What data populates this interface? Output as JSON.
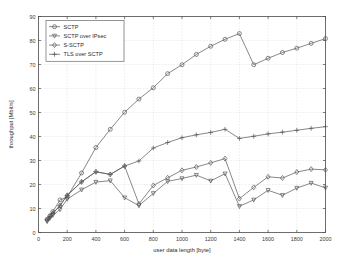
{
  "chart_data": {
    "type": "line",
    "title": "",
    "xlabel": "user data length [byte]",
    "ylabel": "throughput [Mbit/s]",
    "xlim": [
      0,
      2000
    ],
    "ylim": [
      0,
      90
    ],
    "xticks": [
      0,
      200,
      400,
      600,
      800,
      1000,
      1200,
      1400,
      1600,
      1800,
      2000
    ],
    "yticks": [
      0,
      10,
      20,
      30,
      40,
      50,
      60,
      70,
      80,
      90
    ],
    "grid": true,
    "legend_position": "upper left",
    "line_color": "#555555",
    "grid_color": "#c8c8c8",
    "axis_color": "#4a4a4a",
    "background": "#ffffff",
    "series": [
      {
        "name": "SCTP",
        "marker": "circle",
        "x": [
          60,
          80,
          100,
          150,
          200,
          300,
          400,
          500,
          600,
          700,
          800,
          900,
          1000,
          1100,
          1200,
          1300,
          1400,
          1500,
          1600,
          1700,
          1800,
          1900,
          2000
        ],
        "values": [
          5.5,
          7.0,
          8.7,
          13.6,
          14.8,
          24.8,
          35.4,
          43.0,
          50.1,
          55.6,
          60.3,
          66.2,
          69.9,
          74.2,
          77.6,
          80.5,
          82.9,
          69.9,
          72.6,
          75.0,
          76.8,
          78.8,
          80.8
        ]
      },
      {
        "name": "SCTP over IPsec",
        "marker": "triangle-down",
        "x": [
          60,
          80,
          100,
          150,
          200,
          300,
          400,
          500,
          600,
          700,
          800,
          900,
          1000,
          1100,
          1200,
          1300,
          1400,
          1500,
          1600,
          1700,
          1800,
          1900,
          2000
        ],
        "values": [
          4.6,
          6.0,
          7.2,
          9.6,
          13.9,
          17.8,
          21.0,
          21.6,
          14.5,
          11.2,
          16.3,
          21.3,
          22.5,
          23.9,
          21.5,
          24.5,
          10.9,
          13.6,
          17.6,
          15.5,
          18.5,
          20.6,
          18.6
        ]
      },
      {
        "name": "S-SCTP",
        "marker": "diamond",
        "x": [
          60,
          80,
          100,
          150,
          200,
          300,
          400,
          500,
          600,
          700,
          800,
          900,
          1000,
          1100,
          1200,
          1300,
          1400,
          1500,
          1600,
          1700,
          1800,
          1900,
          2000
        ],
        "values": [
          5.2,
          6.6,
          8.0,
          11.2,
          15.5,
          21.1,
          25.3,
          24.2,
          27.7,
          11.9,
          19.6,
          22.8,
          25.9,
          27.3,
          29.0,
          30.8,
          14.1,
          18.8,
          23.2,
          22.7,
          25.2,
          26.4,
          26.1
        ]
      },
      {
        "name": "TLS over SCTP",
        "marker": "plus",
        "x": [
          60,
          80,
          100,
          150,
          200,
          300,
          400,
          500,
          600,
          700,
          800,
          900,
          1000,
          1100,
          1200,
          1300,
          1400,
          1500,
          1600,
          1700,
          1800,
          1900,
          2000
        ],
        "values": [
          5.2,
          6.6,
          8.0,
          11.2,
          15.5,
          21.1,
          25.3,
          24.2,
          27.7,
          29.8,
          35.2,
          37.5,
          39.5,
          40.7,
          41.7,
          43.0,
          39.2,
          40.1,
          41.1,
          41.8,
          42.6,
          43.4,
          44.1
        ]
      }
    ]
  }
}
